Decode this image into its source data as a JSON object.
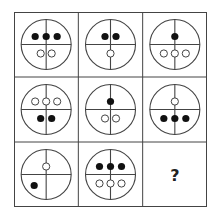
{
  "puzzle": {
    "rows": 3,
    "cols": 3,
    "question_mark": "?",
    "colors": {
      "line": "#444444",
      "filled": "#111111",
      "hollow_stroke": "#444444",
      "background": "#ffffff"
    },
    "cells": [
      {
        "row": 0,
        "col": 0,
        "top": [
          "filled",
          "filled",
          "filled"
        ],
        "bottom": [
          "hollow",
          "hollow"
        ]
      },
      {
        "row": 0,
        "col": 1,
        "top": [
          "filled",
          "filled"
        ],
        "bottom": [
          "hollow"
        ]
      },
      {
        "row": 0,
        "col": 2,
        "top": [
          "filled"
        ],
        "bottom": [
          "hollow",
          "hollow",
          "hollow"
        ]
      },
      {
        "row": 1,
        "col": 0,
        "top": [
          "hollow",
          "hollow",
          "hollow"
        ],
        "bottom": [
          "filled",
          "filled"
        ]
      },
      {
        "row": 1,
        "col": 1,
        "top": [
          "filled"
        ],
        "bottom": [
          "hollow",
          "hollow"
        ]
      },
      {
        "row": 1,
        "col": 2,
        "top": [
          "hollow"
        ],
        "bottom": [
          "filled",
          "filled",
          "filled"
        ]
      },
      {
        "row": 2,
        "col": 0,
        "top": [
          "hollow"
        ],
        "bottom_left": [
          "filled"
        ]
      },
      {
        "row": 2,
        "col": 1,
        "top": [
          "filled",
          "filled",
          "filled"
        ],
        "bottom": [
          "hollow",
          "hollow",
          "hollow"
        ]
      },
      {
        "row": 2,
        "col": 2,
        "unknown": true
      }
    ]
  }
}
